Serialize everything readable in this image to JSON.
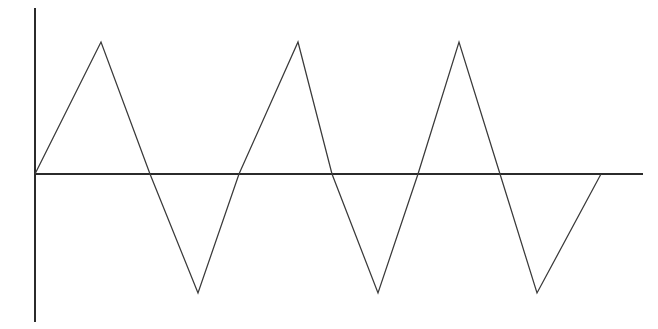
{
  "figure": {
    "background_color": "#ffffff",
    "width": 658,
    "height": 329,
    "title": "",
    "subtitle": ""
  },
  "axes": {
    "y_axis": {
      "name": "vertical-axis",
      "color": "#2b2b2b",
      "thickness": 2.1,
      "x": 35,
      "y_top": 8,
      "y_bottom": 322,
      "label": "",
      "ticks": [],
      "tick_labels": []
    },
    "x_axis": {
      "name": "horizontal-axis",
      "color": "#2b2b2b",
      "thickness": 2.1,
      "y": 174,
      "x_left": 35,
      "x_right": 643,
      "label": "",
      "ticks": [],
      "tick_labels": []
    }
  },
  "chart_data": {
    "type": "line",
    "title": "",
    "subtitle": "",
    "xlabel": "",
    "ylabel": "",
    "grid": false,
    "legend": null,
    "legend_position": "none",
    "series": [
      {
        "name": "triangle-wave",
        "color": "#3a3a3a",
        "linewidth": 1.25,
        "waveform": "triangle",
        "periods": 3.5,
        "amplitude": 1.0,
        "starts_at_origin": true,
        "x": [
          0.0,
          0.25,
          0.5,
          0.75,
          1.0,
          1.25,
          1.5,
          1.75,
          2.0,
          2.25,
          2.5,
          2.75,
          3.0
        ],
        "y": [
          0,
          1,
          0,
          -1,
          0,
          1,
          0,
          -1,
          0,
          1,
          0,
          -1,
          0
        ],
        "pixel_points": [
          [
            35,
            174
          ],
          [
            101,
            42
          ],
          [
            150,
            174
          ],
          [
            198,
            293
          ],
          [
            239,
            174
          ],
          [
            298,
            42
          ],
          [
            332,
            174
          ],
          [
            378,
            293
          ],
          [
            418,
            174
          ],
          [
            459,
            42
          ],
          [
            500,
            174
          ],
          [
            537,
            293
          ],
          [
            601,
            174
          ]
        ]
      }
    ],
    "xlim": [
      0,
      3.1
    ],
    "ylim": [
      -1.3,
      1.3
    ],
    "peaks_pixel_y": 42,
    "troughs_pixel_y": 293,
    "zero_pixel_y": 174
  }
}
